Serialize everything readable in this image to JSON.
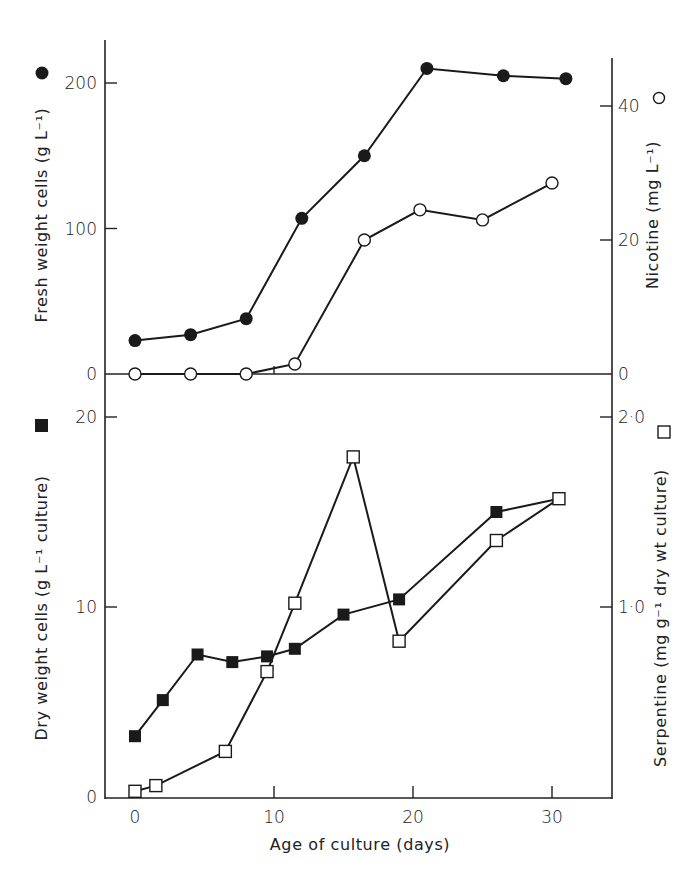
{
  "chart_data": [
    {
      "panel": "top",
      "type": "line",
      "title": "",
      "xlabel": "Age of culture (days)",
      "ylabel": "Fresh weight cells (g L⁻¹)",
      "ylabel_marker": "filled-circle",
      "y2label": "Nicotine (mg L⁻¹)",
      "y2label_marker": "open-circle",
      "xlim": [
        -2,
        34
      ],
      "ylim": [
        0,
        230
      ],
      "y2lim": [
        0,
        52
      ],
      "xticks": [
        0,
        10,
        20,
        30
      ],
      "yticks": [
        0,
        100,
        200
      ],
      "y2ticks": [
        0,
        20,
        40
      ],
      "grid": false,
      "series": [
        {
          "name": "Fresh weight cells",
          "axis": "left",
          "marker": "filled-circle",
          "x": [
            0,
            4,
            8,
            12,
            16.5,
            21,
            26.5,
            31
          ],
          "values": [
            23,
            27,
            38,
            107,
            150,
            210,
            205,
            203
          ]
        },
        {
          "name": "Nicotine",
          "axis": "right",
          "marker": "open-circle",
          "x": [
            0,
            4,
            8,
            11.5,
            16.5,
            20.5,
            25,
            30
          ],
          "values": [
            0,
            0,
            0,
            1.5,
            20,
            24.5,
            23,
            28.5
          ]
        }
      ]
    },
    {
      "panel": "bottom",
      "type": "line",
      "title": "",
      "xlabel": "Age of culture (days)",
      "ylabel": "Dry weight cells (g L⁻¹ culture)",
      "ylabel_marker": "filled-square",
      "y2label": "Serpentine (mg g⁻¹ dry wt culture)",
      "y2label_marker": "open-square",
      "xlim": [
        -2,
        34
      ],
      "ylim": [
        0,
        22
      ],
      "y2lim": [
        0,
        2.2
      ],
      "xticks": [
        0,
        10,
        20,
        30
      ],
      "yticks": [
        0,
        10,
        20
      ],
      "y2ticks": [
        1.0,
        2.0
      ],
      "grid": false,
      "series": [
        {
          "name": "Dry weight cells",
          "axis": "left",
          "marker": "filled-square",
          "x": [
            0,
            2,
            4.5,
            7,
            9.5,
            11.5,
            15,
            19,
            26,
            30.5
          ],
          "values": [
            3.2,
            5.1,
            7.5,
            7.1,
            7.4,
            7.8,
            9.6,
            10.4,
            15.0,
            15.7
          ]
        },
        {
          "name": "Serpentine",
          "axis": "right",
          "marker": "open-square",
          "x": [
            0,
            1.5,
            6.5,
            9.5,
            11.5,
            15.7,
            19,
            26,
            30.5
          ],
          "values": [
            0.03,
            0.06,
            0.24,
            0.66,
            1.02,
            1.79,
            0.82,
            1.35,
            1.57
          ]
        }
      ]
    }
  ],
  "labels": {
    "top_y_left_ticks": [
      "0",
      "100",
      "200"
    ],
    "top_y_right_ticks": [
      "0",
      "20",
      "40"
    ],
    "bottom_y_left_ticks": [
      "0",
      "10",
      "20"
    ],
    "bottom_y_right_ticks": [
      "1·0",
      "2·0"
    ],
    "x_ticks": [
      "0",
      "10",
      "20",
      "30"
    ],
    "x_title": "Age of culture (days)",
    "top_y_left_title": "Fresh weight cells (g L⁻¹)",
    "top_y_right_title": "Nicotine (mg L⁻¹)",
    "bottom_y_left_title": "Dry weight cells (g L⁻¹ culture)",
    "bottom_y_right_title": "Serpentine (mg g⁻¹ dry wt culture)"
  },
  "colors": {
    "ink": "#1a1a1a",
    "background": "#ffffff"
  }
}
